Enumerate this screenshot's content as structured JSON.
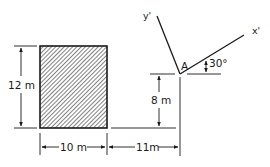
{
  "diagram": {
    "type": "engineering-area-figure",
    "shape": {
      "kind": "rectangle",
      "fill": "hatched",
      "width_label": "10 m",
      "height_label": "12 m"
    },
    "dimensions": {
      "height": "12 m",
      "width": "10 m",
      "offset_horizontal": "11m",
      "offset_vertical": "8 m"
    },
    "point": {
      "label": "A"
    },
    "axes": {
      "x_prime": "x'",
      "y_prime": "y'",
      "angle_label": "30°"
    },
    "colors": {
      "line": "#1a1a1a",
      "background": "#ffffff"
    }
  }
}
